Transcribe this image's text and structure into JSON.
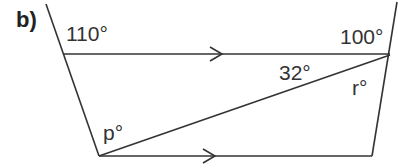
{
  "part_label": "b)",
  "angles": {
    "top_left": "110°",
    "top_right": "100°",
    "diagonal_top": "32°",
    "right_lower": "r°",
    "bottom_left": "p°"
  },
  "colors": {
    "line": "#333333",
    "text": "#333333",
    "background": "#ffffff"
  }
}
